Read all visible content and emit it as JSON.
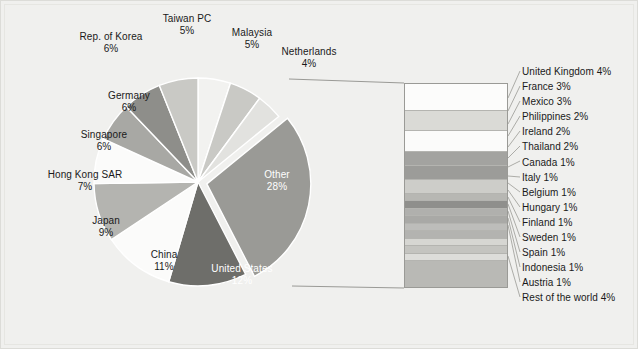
{
  "chart_data": {
    "type": "pie",
    "title": "",
    "subtitle": "",
    "xlabel": "",
    "ylabel": "",
    "legend_position": "right",
    "grid": false,
    "value_unit": "%",
    "exploded_slice": "Other",
    "categories": [
      "Taiwan PC",
      "Malaysia",
      "Netherlands",
      "Other",
      "United States",
      "China",
      "Japan",
      "Hong Kong SAR",
      "Singapore",
      "Germany",
      "Rep. of Korea"
    ],
    "values": [
      5,
      5,
      4,
      28,
      12,
      11,
      9,
      7,
      6,
      6,
      6
    ],
    "slice_colors": [
      "#f2f2f0",
      "#c9c9c5",
      "#e2e2df",
      "#9a9a96",
      "#6e6e6a",
      "#fbfbfa",
      "#b4b4b0",
      "#fbfbfa",
      "#a8a8a4",
      "#8e8e8a",
      "#c9c9c5"
    ],
    "breakout": {
      "type": "bar",
      "source_slice": "Other",
      "orientation": "vertical-stacked",
      "categories": [
        "United Kingdom",
        "France",
        "Mexico",
        "Philippines",
        "Ireland",
        "Thailand",
        "Canada",
        "Italy",
        "Belgium",
        "Hungary",
        "Finland",
        "Sweden",
        "Spain",
        "Indonesia",
        "Austria",
        "Rest of the world"
      ],
      "values": [
        4,
        3,
        3,
        2,
        2,
        2,
        1,
        1,
        1,
        1,
        1,
        1,
        1,
        1,
        1,
        4
      ],
      "segment_colors": [
        "#fcfcfb",
        "#dadad6",
        "#fbfbfa",
        "#a3a3a0",
        "#9c9c99",
        "#cdcdc9",
        "#b7b7b3",
        "#8f8f8c",
        "#b0b0ad",
        "#a9a9a6",
        "#bdbdba",
        "#b3b3b0",
        "#d6d6d2",
        "#c4c4c0",
        "#dddddA",
        "#b9b9b5"
      ]
    }
  },
  "pie_labels": [
    {
      "name": "Rep. of Korea",
      "pct": "6%"
    },
    {
      "name": "Taiwan PC",
      "pct": "5%"
    },
    {
      "name": "Malaysia",
      "pct": "5%"
    },
    {
      "name": "Netherlands",
      "pct": "4%"
    },
    {
      "name": "Germany",
      "pct": "6%"
    },
    {
      "name": "Singapore",
      "pct": "6%"
    },
    {
      "name": "Hong Kong SAR",
      "pct": "7%"
    },
    {
      "name": "Japan",
      "pct": "9%"
    },
    {
      "name": "China",
      "pct": "11%"
    },
    {
      "name": "United States",
      "pct": "12%"
    },
    {
      "name": "Other",
      "pct": "28%"
    }
  ],
  "legend": {
    "items": [
      "United Kingdom 4%",
      "France 3%",
      "Mexico 3%",
      "Philippines 2%",
      "Ireland 2%",
      "Thailand 2%",
      "Canada 1%",
      "Italy 1%",
      "Belgium 1%",
      "Hungary 1%",
      "Finland 1%",
      "Sweden 1%",
      "Spain 1%",
      "Indonesia 1%",
      "Austria 1%",
      "Rest of the world 4%"
    ]
  },
  "colors": {
    "background": "#f0f0ee",
    "text": "#1a1a1a",
    "inverse_text": "#ffffff",
    "outline": "#9a9a96"
  }
}
